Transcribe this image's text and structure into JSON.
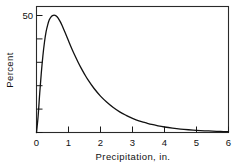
{
  "chart_data": {
    "type": "line",
    "title": "",
    "subtitle": "",
    "xlabel": "Precipitation, in.",
    "ylabel": "Percent",
    "xlim": [
      0,
      6
    ],
    "ylim": [
      0,
      55
    ],
    "xticks": [
      0,
      1,
      2,
      3,
      4,
      5,
      6
    ],
    "xticklabels": [
      "0",
      "1",
      "2",
      "3",
      "4",
      "5",
      "6"
    ],
    "yticks": [
      0,
      10,
      20,
      30,
      40,
      50
    ],
    "yticklabels": [
      "",
      "",
      "",
      "",
      "",
      "50"
    ],
    "grid": false,
    "legend": false,
    "legend_position": "none",
    "frame": "box",
    "annotations": [],
    "series": [
      {
        "name": "Precipitation frequency distribution",
        "x": [
          0.0,
          0.05,
          0.1,
          0.15,
          0.2,
          0.25,
          0.3,
          0.35,
          0.4,
          0.45,
          0.5,
          0.55,
          0.6,
          0.65,
          0.7,
          0.75,
          0.8,
          0.9,
          1.0,
          1.1,
          1.2,
          1.3,
          1.4,
          1.5,
          1.6,
          1.8,
          2.0,
          2.2,
          2.4,
          2.6,
          2.8,
          3.0,
          3.2,
          3.4,
          3.6,
          3.8,
          4.0,
          4.25,
          4.5,
          4.75,
          5.0,
          5.25,
          5.5,
          5.75,
          6.0
        ],
        "y": [
          0.0,
          7.0,
          17.0,
          26.0,
          33.5,
          39.5,
          44.0,
          47.0,
          49.2,
          50.4,
          51.0,
          51.2,
          51.0,
          50.4,
          49.4,
          48.2,
          46.7,
          43.4,
          40.0,
          36.7,
          33.6,
          30.7,
          28.0,
          25.5,
          23.2,
          19.2,
          15.9,
          13.2,
          10.9,
          9.0,
          7.5,
          6.2,
          5.1,
          4.3,
          3.5,
          2.9,
          2.4,
          1.9,
          1.5,
          1.2,
          0.95,
          0.75,
          0.6,
          0.45,
          0.35
        ],
        "color": "#111111"
      }
    ]
  },
  "axes": {
    "y_tick_label_50": "50",
    "x_tick_labels": [
      "0",
      "1",
      "2",
      "3",
      "4",
      "5",
      "6"
    ],
    "x_axis_title": "Precipitation, in.",
    "y_axis_title": "Percent"
  },
  "colors": {
    "curve": "#111111",
    "axis": "#1a1a1a",
    "background": "#ffffff",
    "text": "#111111"
  }
}
